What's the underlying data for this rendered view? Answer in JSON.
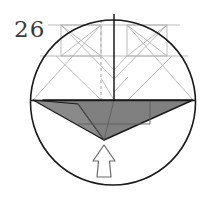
{
  "figure": {
    "kind": "origami-diagram",
    "step_number": "26",
    "caption": "",
    "canvas": {
      "width": 217,
      "height": 203,
      "background": "#ffffff"
    }
  },
  "colors": {
    "outline": "#1a1a1a",
    "crease_line": "#b3b3b3",
    "crease_line_dark": "#8c8c8c",
    "dashed_fold": "#b8b8b8",
    "shaded_flap": "#808080",
    "shaded_flap_edge": "#1a1a1a",
    "arrow_stroke": "#5a5a5a",
    "arrow_fill": "#ffffff",
    "number_color": "#3a3a3a",
    "paper_white": "#ffffff"
  },
  "geometry": {
    "circle": {
      "cx": 113,
      "cy": 102.5,
      "r": 82.5,
      "stroke_width": 1.6
    },
    "horizontal_diameter": {
      "x1": 30.5,
      "y1": 100.5,
      "x2": 195.5,
      "y2": 100.5
    },
    "center_vertical_line": {
      "x1": 114,
      "y1": 14,
      "x2": 114,
      "y2": 101
    },
    "dashed_fold_line": {
      "x": 101,
      "y1": 20,
      "x2": 101,
      "y2": 134,
      "dash": "3 3"
    },
    "flap_apex": {
      "x": 104,
      "y": 140
    },
    "flap_left_corner": {
      "x": 33,
      "y": 100
    },
    "flap_right_corner": {
      "x": 193,
      "y": 100
    }
  },
  "elements": {
    "step_number": {
      "label": "26",
      "x": 15,
      "y": 35
    },
    "circle_outline": {
      "name": "paper-circle-outline"
    },
    "horizontal_crease": {
      "name": "horizontal-diameter-crease"
    },
    "vertical_center": {
      "name": "vertical-center-crease"
    },
    "dashed_valley_fold": {
      "name": "dashed-valley-fold-line"
    },
    "left_crease_box": {
      "name": "left-upper-crease-box"
    },
    "right_crease_box": {
      "name": "right-upper-crease-box"
    },
    "shaded_flap": {
      "name": "shaded-folded-flap"
    },
    "fold_arrow": {
      "name": "fold-direction-arrow",
      "direction": "up"
    }
  },
  "crease_lines": {
    "left_box": {
      "rect": {
        "x": 61,
        "y": 25,
        "w": 40,
        "h": 31
      },
      "diag_a": {
        "x1": 61,
        "y1": 25,
        "x2": 101,
        "y2": 56
      },
      "diag_b": {
        "x1": 101,
        "y1": 25,
        "x2": 61,
        "y2": 56
      }
    },
    "right_box": {
      "rect": {
        "x": 127,
        "y": 25,
        "w": 40,
        "h": 31
      },
      "diag_a": {
        "x1": 127,
        "y1": 25,
        "x2": 167,
        "y2": 56
      },
      "diag_b": {
        "x1": 167,
        "y1": 25,
        "x2": 127,
        "y2": 56
      }
    },
    "outer_diagonals": [
      {
        "x1": 33,
        "y1": 100,
        "x2": 101,
        "y2": 25
      },
      {
        "x1": 193,
        "y1": 100,
        "x2": 127,
        "y2": 25
      },
      {
        "x1": 61,
        "y1": 25,
        "x2": 114,
        "y2": 78
      },
      {
        "x1": 167,
        "y1": 25,
        "x2": 114,
        "y2": 78
      },
      {
        "x1": 101,
        "y1": 56,
        "x2": 114,
        "y2": 70
      },
      {
        "x1": 127,
        "y1": 56,
        "x2": 114,
        "y2": 70
      },
      {
        "x1": 101,
        "y1": 78,
        "x2": 114,
        "y2": 100
      },
      {
        "x1": 127,
        "y1": 78,
        "x2": 114,
        "y2": 100
      }
    ],
    "horizontal_creases": [
      {
        "x1": 48,
        "y1": 25,
        "x2": 180,
        "y2": 25
      },
      {
        "x1": 40,
        "y1": 56,
        "x2": 188,
        "y2": 56
      }
    ]
  },
  "flap": {
    "main_polygon": "43,100 193,100 104,140",
    "sliver_polygon": "33,100 76,103 104,140",
    "inner_fold_lines": [
      {
        "x1": 114,
        "y1": 100,
        "x2": 104,
        "y2": 140
      },
      {
        "x1": 76,
        "y1": 103,
        "x2": 104,
        "y2": 140
      },
      {
        "x1": 76,
        "y1": 124,
        "x2": 148,
        "y2": 124
      }
    ]
  },
  "arrow": {
    "polygon": "104,146 114,160 109,160 111,176 97,176 99,160 94,160",
    "stroke_width": 1.2
  }
}
